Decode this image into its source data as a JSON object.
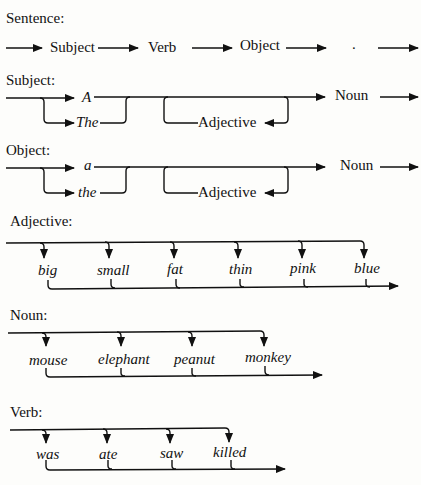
{
  "sections": {
    "sentence": {
      "title": "Sentence:",
      "items": [
        "Subject",
        "Verb",
        "Object",
        "."
      ]
    },
    "subject": {
      "title": "Subject:",
      "articles": [
        "A",
        "The"
      ],
      "adjective": "Adjective",
      "noun": "Noun"
    },
    "object": {
      "title": "Object:",
      "articles": [
        "a",
        "the"
      ],
      "adjective": "Adjective",
      "noun": "Noun"
    },
    "adjective": {
      "title": "Adjective:",
      "words": [
        "big",
        "small",
        "fat",
        "thin",
        "pink",
        "blue"
      ]
    },
    "noun": {
      "title": "Noun:",
      "words": [
        "mouse",
        "elephant",
        "peanut",
        "monkey"
      ]
    },
    "verb": {
      "title": "Verb:",
      "words": [
        "was",
        "ate",
        "saw",
        "killed"
      ]
    }
  },
  "colors": {
    "ink": "#111111",
    "paper": "#fdfdfb"
  }
}
